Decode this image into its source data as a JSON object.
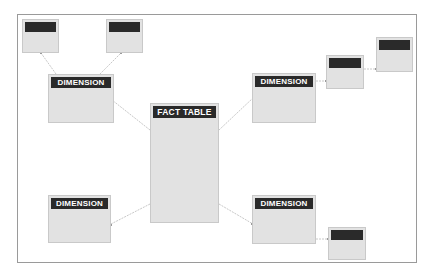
{
  "diagram": {
    "type": "star-snowflake-schema",
    "fact_table": {
      "label": "FACT TABLE"
    },
    "dimensions": [
      {
        "id": "dim-top-left",
        "label": "DIMENSION"
      },
      {
        "id": "dim-top-right",
        "label": "DIMENSION"
      },
      {
        "id": "dim-bottom-left",
        "label": "DIMENSION"
      },
      {
        "id": "dim-bottom-right",
        "label": "DIMENSION"
      }
    ],
    "sub_dimensions": [
      {
        "id": "sub-1",
        "label": "",
        "parent": "dim-top-left"
      },
      {
        "id": "sub-2",
        "label": "",
        "parent": "dim-top-left"
      },
      {
        "id": "sub-3",
        "label": "",
        "parent": "dim-top-right"
      },
      {
        "id": "sub-4",
        "label": "",
        "parent": "sub-3"
      },
      {
        "id": "sub-5",
        "label": "",
        "parent": "dim-bottom-right"
      }
    ],
    "colors": {
      "header": "#2a2a2a",
      "header_text": "#ffffff",
      "box_fill": "#e2e2e2",
      "box_border": "#c9c9c9",
      "connector": "#c8c8c8",
      "frame_border": "#9a9a9a"
    }
  }
}
